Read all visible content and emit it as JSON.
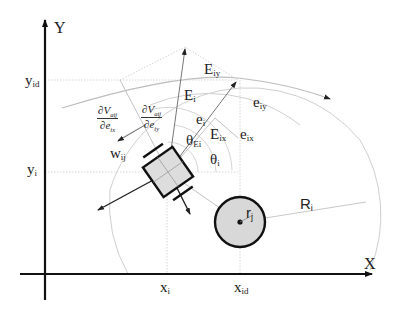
{
  "diagram": {
    "type": "robot-obstacle-avoidance-geometry",
    "axes": {
      "x_label": "X",
      "y_label": "Y"
    },
    "ticks": {
      "y_id": {
        "base": "y",
        "sub": "id"
      },
      "y_i": {
        "base": "y",
        "sub": "i"
      },
      "x_i": {
        "base": "x",
        "sub": "i"
      },
      "x_id": {
        "base": "x",
        "sub": "id"
      }
    },
    "vectors": {
      "E_i": {
        "base": "E",
        "sub": "i"
      },
      "E_iy": {
        "base": "E",
        "sub": "iy"
      },
      "E_ix": {
        "base": "E",
        "sub": "ix"
      },
      "e_i": {
        "base": "e",
        "sub": "i"
      },
      "e_iy": {
        "base": "e",
        "sub": "iy"
      },
      "e_ix": {
        "base": "e",
        "sub": "ix"
      },
      "w_ij": {
        "base": "w",
        "sub": "ij"
      }
    },
    "angles": {
      "theta_Ei": {
        "base": "θ",
        "sub": "Ei"
      },
      "theta_i": {
        "base": "θ",
        "sub": "i"
      }
    },
    "partials": {
      "dV_dex": {
        "num": "∂V",
        "num_sub": "aij",
        "den": "∂e",
        "den_sub": "ix"
      },
      "dV_dey": {
        "num": "∂V",
        "num_sub": "aij",
        "den": "∂e",
        "den_sub": "iy"
      }
    },
    "obstacle": {
      "r_label": {
        "base": "r",
        "sub": "j"
      },
      "R_label": {
        "base": "R",
        "sub": "i"
      }
    },
    "colors": {
      "axis": "#111111",
      "guide": "#c8c8c8",
      "robot_fill": "#dcdcdc",
      "obstacle_fill": "#d8d8d8"
    }
  }
}
